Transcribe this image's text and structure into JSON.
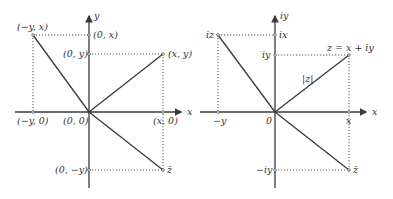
{
  "left_diagram": {
    "axis_x_label": "x",
    "axis_y_label": "y",
    "labels": {
      "neg_y_x": "(−y, x)",
      "zero_x": "(0, x)",
      "zero_y": "(0, y)",
      "x_y": "(x, y)",
      "neg_y_zero": "(−y, 0)",
      "origin": "(0, 0)",
      "x_zero": "(x, 0)",
      "zero_neg_y": "(0, −y)",
      "z_bar": "z̄"
    }
  },
  "right_diagram": {
    "axis_x_label": "x",
    "axis_y_label": "iy",
    "labels": {
      "iz": "iz",
      "ix": "ix",
      "iy": "iy",
      "z_eq": "z = x + iy",
      "modulus": "|z|",
      "neg_y": "−y",
      "origin": "0",
      "x": "x",
      "neg_iy": "−iy",
      "z_bar": "z̄"
    }
  },
  "colors": {
    "line": "#3a3a3a",
    "text": "#333333",
    "background": "#ffffff"
  }
}
